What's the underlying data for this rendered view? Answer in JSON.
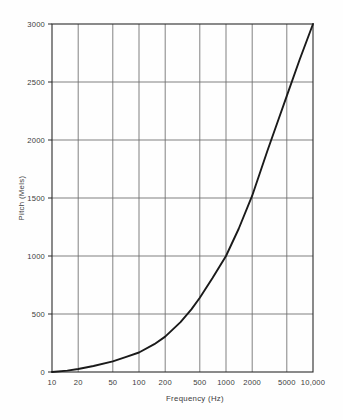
{
  "chart_data": {
    "type": "line",
    "title": "",
    "xlabel": "Frequency (Hz)",
    "ylabel": "Pitch (Mels)",
    "x_scale": "log",
    "y_scale": "linear",
    "xlim": [
      10,
      10000
    ],
    "ylim": [
      0,
      3000
    ],
    "grid": true,
    "legend": null,
    "x_tick_labels": [
      "10",
      "20",
      "50",
      "100",
      "200",
      "500",
      "1000",
      "2000",
      "5000",
      "10,000"
    ],
    "x_tick_values": [
      10,
      20,
      50,
      100,
      200,
      500,
      1000,
      2000,
      5000,
      10000
    ],
    "y_tick_labels": [
      "0",
      "500",
      "1000",
      "1500",
      "2000",
      "2500",
      "3000"
    ],
    "y_tick_values": [
      0,
      500,
      1000,
      1500,
      2000,
      2500,
      3000
    ],
    "series": [
      {
        "name": "Mel scale",
        "x": [
          10,
          15,
          20,
          30,
          50,
          70,
          100,
          150,
          200,
          300,
          400,
          500,
          700,
          1000,
          1400,
          2000,
          3000,
          4000,
          5000,
          7000,
          10000
        ],
        "values": [
          0,
          12,
          26,
          52,
          92,
          128,
          168,
          240,
          305,
          430,
          540,
          640,
          810,
          1000,
          1235,
          1520,
          1910,
          2175,
          2380,
          2690,
          3000
        ]
      }
    ],
    "annotations": [
      {
        "text": "curve passes through (1000 Hz, 1000 Mels)",
        "x": 1000,
        "y": 1000
      }
    ],
    "colors": {
      "curve": "#1a1a1a",
      "grid": "#6b6b6b",
      "axis": "#2b2b2b",
      "background": "#fefefe",
      "text": "#3b3b3b"
    }
  }
}
